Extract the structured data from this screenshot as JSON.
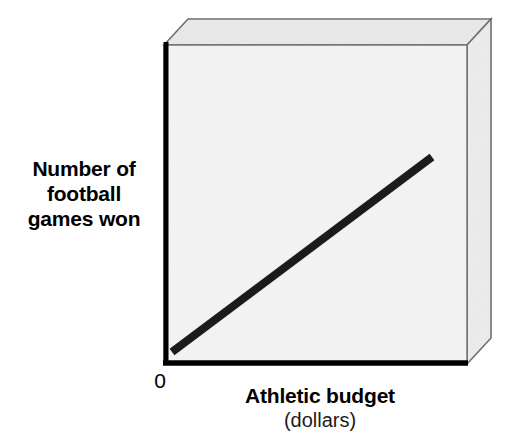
{
  "figure": {
    "kind": "line-trend-diagram",
    "background_color": "#ffffff"
  },
  "axes": {
    "y_title": "Number of\nfootball\ngames won",
    "y_title_lines": [
      "Number of",
      "football",
      "games won"
    ],
    "x_title": "Athletic budget",
    "x_subtitle": "(dollars)",
    "origin_label": "0",
    "axis_color": "#000000"
  },
  "plot_box": {
    "panel_fill": "#f4f4f4",
    "top_face_fill": "#e9e9e9",
    "side_face_fill": "#ececec",
    "edge_color": "#6e6e6e",
    "front_left": 164,
    "front_right": 467,
    "front_top": 45,
    "front_bottom": 364,
    "depth_x": 24,
    "depth_y": 26
  },
  "chart_data": {
    "type": "line",
    "title": "",
    "subtitle": "",
    "xlabel": "Athletic budget",
    "xunits": "(dollars)",
    "ylabel": "Number of football games won",
    "xlim": [
      0,
      1
    ],
    "ylim": [
      0,
      1
    ],
    "grid": false,
    "legend": "none",
    "annotations": [
      "0"
    ],
    "series": [
      {
        "name": "positive correlation trend line",
        "color": "#1b1b1b",
        "line_width_px": 8,
        "x": [
          0.03,
          1.0
        ],
        "y": [
          0.04,
          0.65
        ],
        "pixel_endpoints": [
          [
            172,
            352
          ],
          [
            432,
            157
          ]
        ]
      }
    ]
  }
}
